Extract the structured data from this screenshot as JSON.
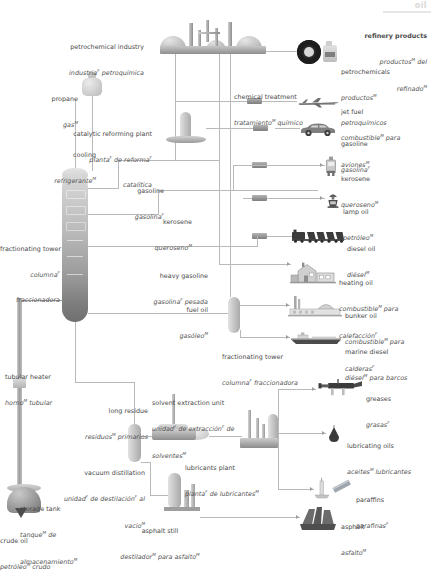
{
  "corner": {
    "tag": "oil"
  },
  "title": {
    "en": "refinery products",
    "es_1": "productos",
    "es_1_sup": "M",
    "es_2": " del",
    "es_3": "refinado",
    "es_3_sup": "M",
    "full_en": "refinery products",
    "full_es": "productos M del refinado M"
  },
  "process_labels": [
    {
      "id": "petrochemical-industry",
      "en": "petrochemical industry",
      "es": "industria",
      "es_sup": "F",
      "es_rest": " petroquímica",
      "x": 80,
      "y": 27,
      "align": "r"
    },
    {
      "id": "chemical-treatment",
      "en": "chemical treatment",
      "es": "tratamiento",
      "es_sup": "M",
      "es_rest": " químico",
      "x": 234,
      "y": 77,
      "align": "l"
    },
    {
      "id": "propane",
      "en": "propane",
      "es": "gas",
      "es_sup": "M",
      "es_rest": "",
      "x": 41,
      "y": 79,
      "align": "r"
    },
    {
      "id": "catalytic-reforming-plant",
      "en": "catalytic reforming plant",
      "es": "planta",
      "es_sup": "F",
      "es_rest": " de reforma",
      "es_rest2": "F",
      "es_line3": "catalítica",
      "x": 98,
      "y": 114,
      "align": "r"
    },
    {
      "id": "cooling",
      "en": "cooling",
      "es": "refrigerante",
      "es_sup": "M",
      "es_rest": "",
      "x": 38,
      "y": 135,
      "align": "r"
    },
    {
      "id": "gasoline-stream",
      "en": "gasoline",
      "es": "gasolina",
      "es_sup": "F",
      "es_rest": "",
      "x": 138,
      "y": 171,
      "align": "r"
    },
    {
      "id": "kerosene-stream",
      "en": "kerosene",
      "es": "queroseno",
      "es_sup": "M",
      "es_rest": "",
      "x": 162,
      "y": 202,
      "align": "r"
    },
    {
      "id": "fractionating-tower-main",
      "en": "fractionating tower",
      "es": "columna",
      "es_sup": "F",
      "es_rest": "",
      "es_line3": "fraccionadora",
      "x": 59,
      "y": 229,
      "align": "r"
    },
    {
      "id": "heavy-gasoline",
      "en": "heavy gasoline",
      "es": "gasolina",
      "es_sup": "F",
      "es_rest": " pesada",
      "x": 198,
      "y": 258,
      "align": "r"
    },
    {
      "id": "fuel-oil-stream",
      "en": "fuel oil",
      "es": "gasóleo",
      "es_sup": "M",
      "es_rest": "",
      "x": 198,
      "y": 291,
      "align": "r"
    },
    {
      "id": "fractionating-tower-2",
      "en": "fractionating tower",
      "es": "columna",
      "es_sup": "F",
      "es_rest": " fraccionadora",
      "x": 222,
      "y": 337,
      "align": "l"
    },
    {
      "id": "tubular-heater",
      "en": "tubular heater",
      "es": "horno",
      "es_sup": "M",
      "es_rest": " tubular",
      "x": 5,
      "y": 357,
      "align": "l"
    },
    {
      "id": "solvent-extraction-unit",
      "en": "solvent extraction unit",
      "es": "unidad",
      "es_sup": "F",
      "es_rest": " de extracción",
      "es_rest2": "F",
      "es_line3": "solventes",
      "es_line3_sup": "M",
      "es_line3_pre": "de ",
      "x": 152,
      "y": 386,
      "align": "l"
    },
    {
      "id": "long-residue",
      "en": "long residue",
      "es": "residuos",
      "es_sup": "M",
      "es_rest": " primarios",
      "x": 148,
      "y": 394,
      "align": "r"
    },
    {
      "id": "lubricants-plant",
      "en": "lubricants plant",
      "es": "planta",
      "es_sup": "F",
      "es_rest": " de lubricantes",
      "es_rest2": "M",
      "x": 222,
      "y": 449,
      "align": "l"
    },
    {
      "id": "vacuum-distillation",
      "en": "vacuum distillation",
      "es": "unidad",
      "es_sup": "F",
      "es_rest": " de destilación",
      "es_rest2": "F",
      "es_line2_tail": " al",
      "es_line3": "vacío",
      "es_line3_sup": "M",
      "x": 143,
      "y": 455,
      "align": "r"
    },
    {
      "id": "storage-tank",
      "en": "storage tank",
      "es": "tanque",
      "es_sup": "M",
      "es_rest": " de",
      "es_line3": "almacenamiento",
      "es_line3_sup": "M",
      "x": 44,
      "y": 489,
      "align": "l"
    },
    {
      "id": "asphalt-still",
      "en": "asphalt still",
      "es": "destilador",
      "es_sup": "M",
      "es_rest": " para asfalto",
      "es_rest2": "M",
      "x": 113,
      "y": 512,
      "align": "l"
    },
    {
      "id": "crude-oil",
      "en": "crude oil",
      "es": "petróleo",
      "es_sup": "M",
      "es_rest": " crudo",
      "x": 2,
      "y": 522,
      "align": "l"
    }
  ],
  "products": [
    {
      "id": "petrochemicals",
      "icon": "tire-and-canister-icon",
      "en": "petrochemicals",
      "es_1": "productos",
      "es_1_sup": "M",
      "es_2": "petroquímicos",
      "x": 341,
      "y": 53
    },
    {
      "id": "jet-fuel",
      "icon": "airplane-icon",
      "en": "jet fuel",
      "es_1": "combustible",
      "es_1_sup": "M",
      "es_1_tail": " para",
      "es_2": "aviones",
      "es_2_sup": "M",
      "x": 341,
      "y": 92
    },
    {
      "id": "gasoline",
      "icon": "car-icon",
      "en": "gasoline",
      "es_1": "gasolina",
      "es_1_sup": "F",
      "x": 341,
      "y": 124
    },
    {
      "id": "kerosene",
      "icon": "jerrycan-icon",
      "en": "kerosene",
      "es_1": "queroseno",
      "es_1_sup": "M",
      "x": 341,
      "y": 159
    },
    {
      "id": "lamp-oil",
      "icon": "oil-lamp-icon",
      "en": "lamp oil",
      "es_1": "petróleo",
      "es_1_sup": "M",
      "x": 341,
      "y": 192
    },
    {
      "id": "diesel-oil",
      "icon": "train-icon",
      "en": "diesel oil",
      "es_1": "diésel",
      "es_1_sup": "M",
      "x": 347,
      "y": 230
    },
    {
      "id": "heating-oil",
      "icon": "house-icon",
      "en": "heating oil",
      "es_1": "combustible",
      "es_1_sup": "M",
      "es_1_tail": " para",
      "es_2": "calefacción",
      "es_2_sup": "F",
      "x": 341,
      "y": 264
    },
    {
      "id": "bunker-oil",
      "icon": "factory-icon",
      "en": "bunker oil",
      "es_1": "combustible",
      "es_1_sup": "M",
      "es_1_tail": " para",
      "es_2": "calderas",
      "es_2_sup": "F",
      "x": 345,
      "y": 297
    },
    {
      "id": "marine-diesel",
      "icon": "ship-icon",
      "en": "marine diesel",
      "es_1": "diésel",
      "es_1_sup": "M",
      "es_1_tail": " para barcos",
      "x": 345,
      "y": 333
    },
    {
      "id": "greases",
      "icon": "grease-gun-icon",
      "en": "greases",
      "es_1": "grasas",
      "es_1_sup": "F",
      "x": 366,
      "y": 379
    },
    {
      "id": "lubricating-oils",
      "icon": "oil-drop-icon",
      "en": "lubricating oils",
      "es_1": "aceites",
      "es_1_sup": "M",
      "es_1_tail": " lubricantes",
      "x": 347,
      "y": 427
    },
    {
      "id": "paraffins",
      "icon": "candle-icon",
      "en": "paraffins",
      "es_1": "parafinas",
      "es_1_sup": "F",
      "x": 356,
      "y": 480
    },
    {
      "id": "asphalt",
      "icon": "asphalt-icon",
      "en": "asphalt",
      "es_1": "asfalto",
      "es_1_sup": "M",
      "x": 341,
      "y": 508
    }
  ],
  "colors": {
    "line": "#b9b9b9",
    "line_dark": "#9d9d9d",
    "text": "#4a4a4a",
    "corner_tag": "#d9d9d9",
    "tower_dark": "#6f6f6f",
    "tower_light": "#d8d8d8"
  }
}
